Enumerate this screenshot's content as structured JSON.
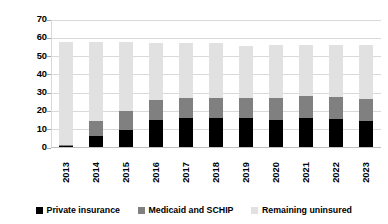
{
  "chart_data": {
    "type": "bar",
    "stacked": true,
    "title": "",
    "xlabel": "",
    "ylabel": "Millions of people",
    "ylim": [
      0,
      70
    ],
    "yticks": [
      0,
      10,
      20,
      30,
      40,
      50,
      60,
      70
    ],
    "grid": true,
    "legend_position": "bottom",
    "categories": [
      "2013",
      "2014",
      "2015",
      "2016",
      "2017",
      "2018",
      "2019",
      "2020",
      "2021",
      "2022",
      "2023"
    ],
    "series": [
      {
        "name": "Private insurance",
        "color": "#000000",
        "values": [
          1.3,
          6.3,
          9.4,
          15.2,
          16.0,
          16.0,
          16.1,
          15.2,
          16.3,
          15.5,
          14.6
        ]
      },
      {
        "name": "Medicaid and SCHIP",
        "color": "#808080",
        "values": [
          0.2,
          8.0,
          10.7,
          11.0,
          11.0,
          11.2,
          11.2,
          11.8,
          11.9,
          12.2,
          12.0
        ]
      },
      {
        "name": "Remaining uninsured",
        "color": "#e1e1e1",
        "values": [
          56.3,
          43.4,
          37.5,
          30.9,
          29.9,
          29.7,
          28.0,
          28.9,
          27.7,
          28.3,
          29.5
        ]
      }
    ],
    "totals": [
      57.8,
      57.7,
      57.6,
      57.1,
      56.9,
      56.9,
      55.3,
      55.9,
      55.9,
      56.0,
      56.1
    ]
  },
  "legend": {
    "items": [
      {
        "label": "Private insurance",
        "color": "#000000"
      },
      {
        "label": "Medicaid and SCHIP",
        "color": "#808080"
      },
      {
        "label": "Remaining uninsured",
        "color": "#e1e1e1"
      }
    ]
  }
}
